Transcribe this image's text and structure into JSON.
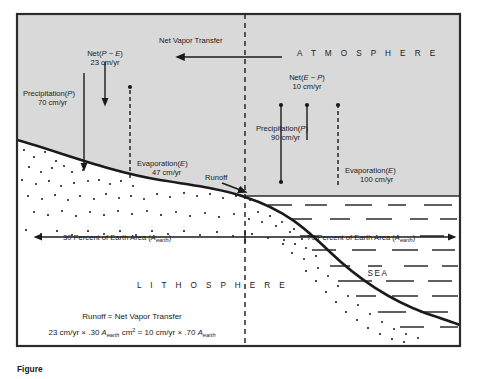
{
  "figure": {
    "caption_partial": "Figure",
    "frame_color": "#2b2b2b",
    "atmosphere_fill": "#d9d9d9",
    "sea_fill": "#ffffff",
    "lithosphere_fill": "#ffffff",
    "ink_color": "#1a1a1a"
  },
  "zones": {
    "atmosphere": "A T M O S P H E R E",
    "lithosphere": "L I T H O S P H E R E",
    "sea": "SEA"
  },
  "flux_labels": {
    "net_vapor_transfer": "Net Vapor Transfer",
    "land_net": {
      "line1_pre": "Net(",
      "line1_var1": "P",
      "line1_mid": " − ",
      "line1_var2": "E",
      "line1_post": ")",
      "line2": "23 cm/yr"
    },
    "land_precipitation": {
      "line1_pre": "Precipitation(",
      "line1_var": "P",
      "line1_post": ")",
      "line2": "70 cm/yr"
    },
    "land_evaporation": {
      "line1_pre": "Evaporation(",
      "line1_var": "E",
      "line1_post": ")",
      "line2": "47 cm/yr"
    },
    "sea_net": {
      "line1_pre": "Net(",
      "line1_var1": "E",
      "line1_mid": " − ",
      "line1_var2": "P",
      "line1_post": ")",
      "line2": "10 cm/yr"
    },
    "sea_precipitation": {
      "line1_pre": "Precipitation(",
      "line1_var": "P",
      "line1_post": ")",
      "line2": "90 cm/yr"
    },
    "sea_evaporation": {
      "line1_pre": "Evaporation(",
      "line1_var": "E",
      "line1_post": ")",
      "line2": "100 cm/yr"
    },
    "runoff": "Runoff"
  },
  "area_labels": {
    "land": {
      "text_pre": "30 Percent of Earth Area (",
      "var": "A",
      "sub": "earth",
      "text_post": ")"
    },
    "sea": {
      "text_pre": "70 Percent of Earth Area (",
      "var": "A",
      "sub": "earth",
      "text_post": ")"
    }
  },
  "balance": {
    "line1": "Runoff = Net Vapor Transfer",
    "line2": {
      "a": "23 cm/yr × .30 ",
      "var1": "A",
      "sub1": "earth",
      "b": " cm",
      "sup": "2",
      "c": " = 10 cm/yr × .70 ",
      "var2": "A",
      "sub2": "earth"
    }
  },
  "values": {
    "land_precipitation_cm_yr": 70,
    "land_evaporation_cm_yr": 47,
    "land_net_cm_yr": 23,
    "sea_precipitation_cm_yr": 90,
    "sea_evaporation_cm_yr": 100,
    "sea_net_cm_yr": 10,
    "land_area_percent": 30,
    "sea_area_percent": 70
  }
}
